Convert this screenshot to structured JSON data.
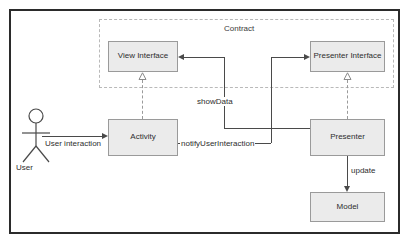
{
  "diagram": {
    "type": "uml-component-diagram",
    "frame_border_color": "#2b2b2b",
    "node_fill_color": "#ebebeb",
    "node_border_color": "#9a9a9a",
    "line_color": "#4a4a4a",
    "dashed_color": "#9a9a9a",
    "group": {
      "label": "Contract",
      "style": "dashed"
    },
    "nodes": [
      {
        "id": "view_interface",
        "label": "View Interface",
        "x": 108,
        "y": 41,
        "w": 70,
        "h": 31
      },
      {
        "id": "presenter_interface",
        "label": "Presenter Interface",
        "x": 310,
        "y": 41,
        "w": 75,
        "h": 31
      },
      {
        "id": "activity",
        "label": "Activity",
        "x": 108,
        "y": 119,
        "w": 70,
        "h": 37
      },
      {
        "id": "presenter",
        "label": "Presenter",
        "x": 310,
        "y": 119,
        "w": 75,
        "h": 37
      },
      {
        "id": "model",
        "label": "Model",
        "x": 310,
        "y": 192,
        "w": 75,
        "h": 30
      }
    ],
    "actor": {
      "id": "user",
      "label": "User"
    },
    "edges": [
      {
        "id": "user_interaction",
        "label": "User interaction",
        "from": "user",
        "to": "activity",
        "style": "solid",
        "arrow": "right"
      },
      {
        "id": "show_data",
        "label": "showData",
        "from": "presenter",
        "to": "view_interface",
        "style": "solid",
        "arrow": "left"
      },
      {
        "id": "notify_user_interaction",
        "label": "notifyUserInteraction",
        "from": "activity",
        "to": "presenter_interface",
        "style": "solid",
        "arrow": "right"
      },
      {
        "id": "update",
        "label": "update",
        "from": "presenter",
        "to": "model",
        "style": "solid",
        "arrow": "down"
      },
      {
        "id": "activity_implements_view",
        "label": "",
        "from": "activity",
        "to": "view_interface",
        "style": "dashed",
        "arrow": "hollow-triangle"
      },
      {
        "id": "presenter_implements_presenter",
        "label": "",
        "from": "presenter",
        "to": "presenter_interface",
        "style": "dashed",
        "arrow": "hollow-triangle"
      }
    ]
  }
}
